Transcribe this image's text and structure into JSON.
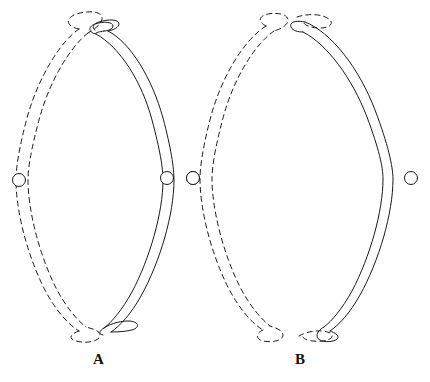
{
  "figure": {
    "type": "line-diagram",
    "background_color": "#ffffff",
    "stroke_color": "#1a1a1a",
    "stroke_width": 1,
    "dash_pattern": "5 4",
    "panels": [
      {
        "id": "panel-a",
        "label": "A",
        "label_position": {
          "x": 93,
          "y": 352
        },
        "description": "Lens-shaped ring formed by one solid ribbon strand and one dashed ribbon strand whose looped ends cross over each other at top and bottom",
        "ends_crossed": true,
        "nodes": [
          {
            "name": "node-left",
            "cx": 19,
            "cy": 180,
            "r": 6.5,
            "on": "dashed-strand"
          },
          {
            "name": "node-right-inner",
            "cx": 167,
            "cy": 178,
            "r": 6.5,
            "on": "solid-strand"
          },
          {
            "name": "node-right-outer",
            "cx": 193,
            "cy": 178,
            "r": 6.5,
            "on": "dashed-strand"
          }
        ]
      },
      {
        "id": "panel-b",
        "label": "B",
        "label_position": {
          "x": 295,
          "y": 352
        },
        "description": "Lens-shaped ring formed by one solid ribbon strand and one dashed ribbon strand whose looped ends meet but do not cross at top and bottom",
        "ends_crossed": false,
        "nodes": [
          {
            "name": "node-left",
            "cx": 193,
            "cy": 178,
            "r": 6.5,
            "on": "dashed-strand"
          },
          {
            "name": "node-right",
            "cx": 411,
            "cy": 178,
            "r": 6.5,
            "on": "solid-strand"
          }
        ]
      }
    ]
  },
  "labels": {
    "a": "A",
    "b": "B"
  }
}
